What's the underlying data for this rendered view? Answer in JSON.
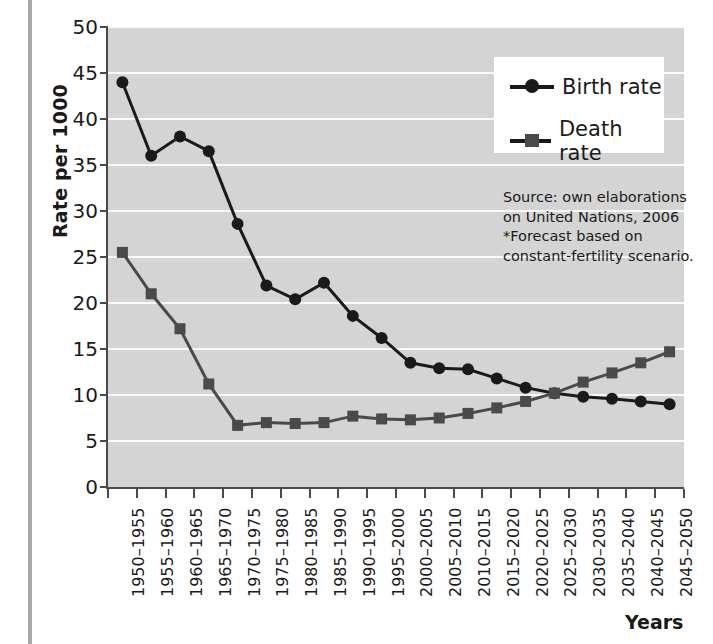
{
  "chart": {
    "ylabel": "Rate per 1000",
    "xlabel": "Years",
    "yticks": [
      "0",
      "5",
      "10",
      "15",
      "20",
      "25",
      "30",
      "35",
      "40",
      "45",
      "50"
    ],
    "legend": [
      {
        "label": "Birth rate",
        "marker": "circle",
        "color": "#1a1a1a"
      },
      {
        "label": "Death rate",
        "marker": "square",
        "color": "#4a4a4a"
      }
    ],
    "note_lines": [
      "Source: own elaborations",
      "on United Nations, 2006",
      "*Forecast based on",
      "constant-fertility scenario."
    ]
  },
  "chart_data": {
    "type": "line",
    "title": "",
    "xlabel": "Years",
    "ylabel": "Rate per 1000",
    "ylim": [
      0,
      50
    ],
    "ytick_step": 5,
    "grid": "horizontal",
    "legend_position": "top-right",
    "categories": [
      "1950–1955",
      "1955–1960",
      "1960–1965",
      "1965–1970",
      "1970–1975",
      "1975–1980",
      "1980–1985",
      "1985–1990",
      "1990–1995",
      "1995–2000",
      "2000–2005",
      "2005–2010",
      "2010–2015",
      "2015–2020",
      "2020–2025",
      "2025–2030",
      "2030–2035",
      "2035–2040",
      "2040–2045",
      "2045–2050"
    ],
    "series": [
      {
        "name": "Birth rate",
        "marker": "circle",
        "color": "#1a1a1a",
        "values": [
          44.0,
          36.0,
          38.1,
          36.5,
          28.6,
          21.9,
          20.4,
          22.2,
          18.6,
          16.2,
          13.5,
          12.9,
          12.8,
          11.8,
          10.8,
          10.2,
          9.8,
          9.6,
          9.3,
          9.0
        ]
      },
      {
        "name": "Death rate",
        "marker": "square",
        "color": "#4a4a4a",
        "values": [
          25.5,
          21.0,
          17.2,
          11.2,
          6.7,
          7.0,
          6.9,
          7.0,
          7.7,
          7.4,
          7.3,
          7.5,
          8.0,
          8.6,
          9.3,
          10.2,
          11.4,
          12.4,
          13.5,
          14.7
        ]
      }
    ],
    "annotations": [
      "Source: own elaborations",
      "on United Nations, 2006",
      "*Forecast based on",
      "constant-fertility scenario."
    ]
  }
}
